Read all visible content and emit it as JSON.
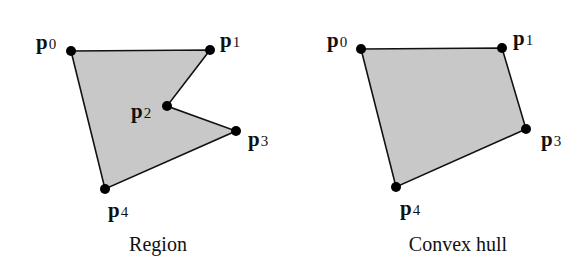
{
  "figures": [
    {
      "id": "region",
      "caption": "Region",
      "caption_pos": [
        158,
        251
      ],
      "fill": "#c8c8c8",
      "stroke": "#111111",
      "points": [
        {
          "name": "p",
          "sub": "0",
          "x": 71,
          "y": 51,
          "lx": 36,
          "ly": 49
        },
        {
          "name": "p",
          "sub": "1",
          "x": 210,
          "y": 50,
          "lx": 220,
          "ly": 47
        },
        {
          "name": "p",
          "sub": "2",
          "x": 167,
          "y": 106,
          "lx": 131,
          "ly": 118
        },
        {
          "name": "p",
          "sub": "3",
          "x": 236,
          "y": 131,
          "lx": 248,
          "ly": 146
        },
        {
          "name": "p",
          "sub": "4",
          "x": 105,
          "y": 189,
          "lx": 108,
          "ly": 217
        }
      ]
    },
    {
      "id": "convex-hull",
      "caption": "Convex hull",
      "caption_pos": [
        458,
        251
      ],
      "fill": "#c8c8c8",
      "stroke": "#111111",
      "points": [
        {
          "name": "p",
          "sub": "0",
          "x": 361,
          "y": 49,
          "lx": 327,
          "ly": 47
        },
        {
          "name": "p",
          "sub": "1",
          "x": 502,
          "y": 48,
          "lx": 513,
          "ly": 45
        },
        {
          "name": "p",
          "sub": "3",
          "x": 526,
          "y": 129,
          "lx": 541,
          "ly": 146
        },
        {
          "name": "p",
          "sub": "4",
          "x": 396,
          "y": 187,
          "lx": 400,
          "ly": 215
        }
      ]
    }
  ],
  "styles": {
    "vertex_color": "#000000",
    "vertex_radius": 5
  }
}
